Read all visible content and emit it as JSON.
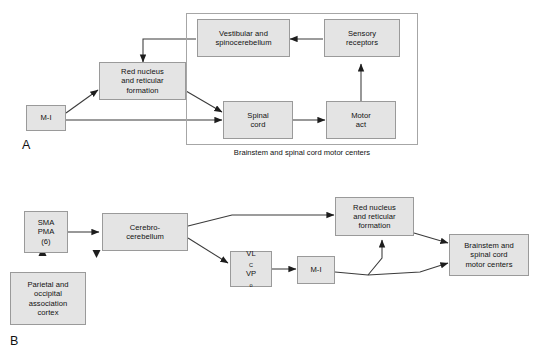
{
  "figure": {
    "background_color": "#ffffff",
    "box_fill": "#e4e4e4",
    "box_border": "#9a9a9a",
    "line_color": "#3a3a3a"
  },
  "panel_a": {
    "letter": "A",
    "caption_line1": "Brainstem and spinal cord",
    "caption_line2": "motor centers",
    "nodes": {
      "m1": {
        "line1": "M-I"
      },
      "red_nucleus": {
        "line1": "Red nucleus",
        "line2": "and reticular",
        "line3": "formation"
      },
      "vestibular": {
        "line1": "Vestibular and",
        "line2": "spinocerebellum"
      },
      "sensory": {
        "line1": "Sensory",
        "line2": "receptors"
      },
      "spinal_cord": {
        "line1": "Spinal",
        "line2": "cord"
      },
      "motor_act": {
        "line1": "Motor",
        "line2": "act"
      }
    }
  },
  "panel_b": {
    "letter": "B",
    "nodes": {
      "sma_pma": {
        "line1": "SMA",
        "line2": "PMA",
        "line3": "(6)"
      },
      "parietal": {
        "line1": "Parietal and",
        "line2": "occipital",
        "line3": "association",
        "line4": "cortex"
      },
      "cerebrocerebellum": {
        "line1": "Cerebro-",
        "line2": "cerebellum"
      },
      "thalamus": {
        "line1_main": "VL",
        "line1_sub": "C",
        "line2_main": "VP",
        "line2_sub": "o"
      },
      "m1": {
        "line1": "M-I"
      },
      "red_nucleus": {
        "line1": "Red nucleus",
        "line2": "and reticular",
        "line3": "formation"
      },
      "brainstem": {
        "line1": "Brainstem and",
        "line2": "spinal cord",
        "line3": "motor centers"
      }
    }
  }
}
